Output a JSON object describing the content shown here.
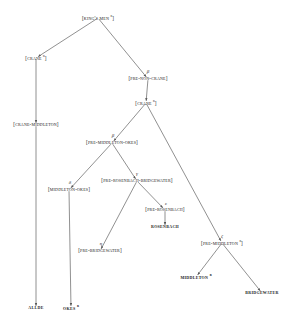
{
  "diagram": {
    "type": "stemma-tree",
    "line_color": "#555555",
    "text_color": "#1a1a1a",
    "background": "#ffffff"
  },
  "nodes": [
    {
      "id": "kings-men",
      "label": "[King's Men ",
      "sup": "n",
      "tail": "]",
      "x": 98,
      "y": 18,
      "leaf": false
    },
    {
      "id": "crane-1",
      "label": "[Crane ",
      "sup": "n",
      "tail": "]",
      "x": 36,
      "y": 58,
      "leaf": false
    },
    {
      "id": "pre-non-crane",
      "label": "[Pre-Non-Crane]",
      "sup": "",
      "tail": "",
      "x": 148,
      "y": 79,
      "leaf": false
    },
    {
      "id": "crane-2",
      "label": "[Crane ",
      "sup": "n",
      "tail": "]",
      "x": 146,
      "y": 103,
      "leaf": false
    },
    {
      "id": "crane-middleton",
      "label": "[Crane-Middleton]",
      "sup": "",
      "tail": "",
      "x": 36,
      "y": 125,
      "leaf": false
    },
    {
      "id": "pre-mid-okes",
      "label": "[Pre-Middleton-Okes]",
      "sup": "",
      "tail": "",
      "x": 112,
      "y": 143,
      "leaf": false
    },
    {
      "id": "pre-ros-bri",
      "label": "[Pre-Rosenbach-Bridgewater]",
      "sup": "",
      "tail": "",
      "x": 137,
      "y": 181,
      "leaf": false
    },
    {
      "id": "middleton-okes",
      "label": "[Middleton-Okes]",
      "sup": "",
      "tail": "",
      "x": 69,
      "y": 190,
      "leaf": false
    },
    {
      "id": "pre-rosenbach",
      "label": "[Pre-Rosenbach]",
      "sup": "",
      "tail": "",
      "x": 165,
      "y": 210,
      "leaf": false
    },
    {
      "id": "rosenbach",
      "label": "Rosenbach",
      "sup": "",
      "tail": "",
      "x": 165,
      "y": 227,
      "leaf": true
    },
    {
      "id": "pre-bridgewater",
      "label": "[Pre-Bridgewater]",
      "sup": "",
      "tail": "",
      "x": 100,
      "y": 251,
      "leaf": false
    },
    {
      "id": "pre-middleton",
      "label": "[Pre-Middleton ",
      "sup": "n",
      "tail": "]",
      "x": 222,
      "y": 243,
      "leaf": false
    },
    {
      "id": "middleton",
      "label": "Middleton ",
      "sup": "n",
      "tail": "",
      "x": 196,
      "y": 277,
      "leaf": true
    },
    {
      "id": "bridgewater",
      "label": "Bridgewater",
      "sup": "",
      "tail": "",
      "x": 262,
      "y": 293,
      "leaf": true
    },
    {
      "id": "allde",
      "label": "Allde",
      "sup": "",
      "tail": "",
      "x": 36,
      "y": 308,
      "leaf": true
    },
    {
      "id": "okes",
      "label": "Okes ",
      "sup": "n",
      "tail": "",
      "x": 71,
      "y": 308,
      "leaf": true
    }
  ],
  "edge_labels": [
    {
      "id": "beta-non-crane",
      "text": "β",
      "x": 148,
      "y": 71
    },
    {
      "id": "beta-mid-okes",
      "text": "β",
      "x": 113,
      "y": 135
    },
    {
      "id": "gamma-ros-bri",
      "text": "γ",
      "x": 137,
      "y": 173
    },
    {
      "id": "delta-mid-okes",
      "text": "δ",
      "x": 70,
      "y": 182
    },
    {
      "id": "epsilon-ros",
      "text": "ε",
      "x": 166,
      "y": 203
    },
    {
      "id": "zeta-middleton",
      "text": "ζ",
      "x": 222,
      "y": 236
    },
    {
      "id": "eta-bridgewater",
      "text": "η",
      "x": 101,
      "y": 243
    }
  ],
  "edges": [
    {
      "from": "kings-men",
      "to": "crane-1",
      "arrow": true
    },
    {
      "from": "kings-men",
      "to": "pre-non-crane",
      "arrow": true
    },
    {
      "from": "pre-non-crane",
      "to": "crane-2",
      "arrow": true
    },
    {
      "from": "crane-1",
      "to": "crane-middleton",
      "arrow": true
    },
    {
      "from": "crane-2",
      "to": "pre-mid-okes",
      "arrow": true
    },
    {
      "from": "crane-2",
      "to": "pre-middleton",
      "arrow": true
    },
    {
      "from": "pre-mid-okes",
      "to": "middleton-okes",
      "arrow": true
    },
    {
      "from": "pre-mid-okes",
      "to": "pre-ros-bri",
      "arrow": true
    },
    {
      "from": "pre-ros-bri",
      "to": "pre-bridgewater",
      "arrow": true
    },
    {
      "from": "pre-ros-bri",
      "to": "pre-rosenbach",
      "arrow": true
    },
    {
      "from": "pre-rosenbach",
      "to": "rosenbach",
      "arrow": true
    },
    {
      "from": "pre-middleton",
      "to": "middleton",
      "arrow": true
    },
    {
      "from": "pre-middleton",
      "to": "bridgewater",
      "arrow": true
    },
    {
      "from": "crane-middleton",
      "to": "allde",
      "arrow": true
    },
    {
      "from": "middleton-okes",
      "to": "okes",
      "arrow": true
    }
  ]
}
